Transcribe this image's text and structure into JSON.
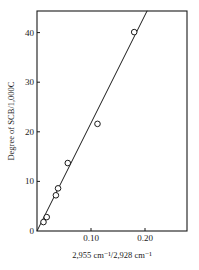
{
  "chart_data": {
    "type": "scatter",
    "title": "",
    "xlabel": "2,955 cm⁻¹/2,928 cm⁻¹",
    "ylabel": "Degree of SCB/1,000C",
    "xlim": [
      0,
      0.28
    ],
    "ylim": [
      0,
      44.4
    ],
    "x_ticks": [
      0.1,
      0.2
    ],
    "x_tick_labels": [
      "0.10",
      "0.20"
    ],
    "y_ticks": [
      0,
      10,
      20,
      30,
      40
    ],
    "y_tick_labels": [
      "0",
      "10",
      "20",
      "30",
      "40"
    ],
    "grid": false,
    "legend": null,
    "series": [
      {
        "name": "measured",
        "marker": "open-circle",
        "points": [
          {
            "x": 0.012,
            "y": 1.8
          },
          {
            "x": 0.018,
            "y": 2.8
          },
          {
            "x": 0.035,
            "y": 7.2
          },
          {
            "x": 0.039,
            "y": 8.6
          },
          {
            "x": 0.057,
            "y": 13.7
          },
          {
            "x": 0.112,
            "y": 21.6
          },
          {
            "x": 0.18,
            "y": 40.1
          }
        ]
      },
      {
        "name": "linear fit",
        "type": "line",
        "points": [
          {
            "x": 0.0,
            "y": 0.0
          },
          {
            "x": 0.204,
            "y": 44.4
          }
        ]
      }
    ]
  },
  "colors": {
    "ink": "#1a1a1a",
    "background": "#ffffff"
  }
}
